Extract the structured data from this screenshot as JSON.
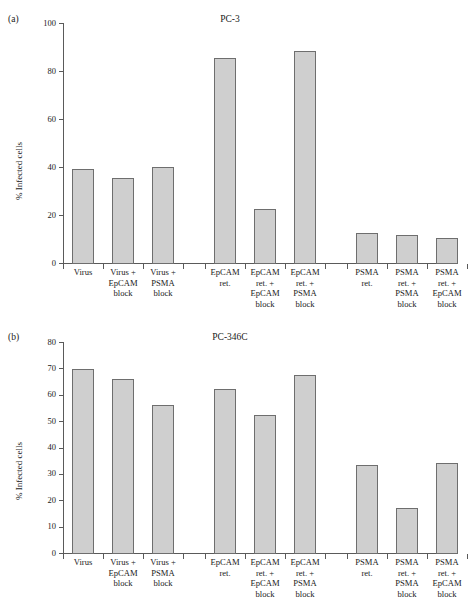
{
  "figure": {
    "panels": [
      {
        "letter": "(a)",
        "title": "PC-3",
        "ylabel": "% Infected cells"
      },
      {
        "letter": "(b)",
        "title": "PC-346C",
        "ylabel": "% Infected cells"
      }
    ]
  },
  "chart_data": [
    {
      "type": "bar",
      "title": "PC-3",
      "panel": "(a)",
      "xlabel": "",
      "ylabel": "% Infected cells",
      "ylim": [
        0,
        100
      ],
      "yticks": [
        0,
        20,
        40,
        60,
        80,
        100
      ],
      "ytick_labels": [
        "0",
        "20",
        "40",
        "60",
        "80",
        "100"
      ],
      "grid": false,
      "legend": "none",
      "groups": [
        {
          "name": "Virus",
          "categories": [
            "Virus",
            "Virus +\nEpCAM\nblock",
            "Virus +\nPSMA\nblock"
          ],
          "values": [
            39,
            35.5,
            40
          ]
        },
        {
          "name": "EpCAM ret.",
          "categories": [
            "EpCAM\nret.",
            "EpCAM\nret. +\nEpCAM\nblock",
            "EpCAM\nret. +\nPSMA\nblock"
          ],
          "values": [
            85.5,
            22.5,
            88.5
          ]
        },
        {
          "name": "PSMA ret.",
          "categories": [
            "PSMA\nret.",
            "PSMA\nret. +\nPSMA\nblock",
            "PSMA\nret. +\nEpCAM\nblock"
          ],
          "values": [
            12.7,
            11.6,
            10.6
          ]
        }
      ],
      "categories": [
        "Virus",
        "Virus +\nEpCAM\nblock",
        "Virus +\nPSMA\nblock",
        "EpCAM\nret.",
        "EpCAM\nret. +\nEpCAM\nblock",
        "EpCAM\nret. +\nPSMA\nblock",
        "PSMA\nret.",
        "PSMA\nret. +\nPSMA\nblock",
        "PSMA\nret. +\nEpCAM\nblock"
      ],
      "values": [
        39,
        35.5,
        40,
        85.5,
        22.5,
        88.5,
        12.7,
        11.6,
        10.6
      ]
    },
    {
      "type": "bar",
      "title": "PC-346C",
      "panel": "(b)",
      "xlabel": "",
      "ylabel": "% Infected cells",
      "ylim": [
        0,
        80
      ],
      "yticks": [
        0,
        10,
        20,
        30,
        40,
        50,
        60,
        70,
        80
      ],
      "ytick_labels": [
        "0",
        "10",
        "20",
        "30",
        "40",
        "50",
        "60",
        "70",
        "80"
      ],
      "grid": false,
      "legend": "none",
      "groups": [
        {
          "name": "Virus",
          "categories": [
            "Virus",
            "Virus +\nEpCAM\nblock",
            "Virus +\nPSMA\nblock"
          ],
          "values": [
            69.7,
            66,
            56
          ]
        },
        {
          "name": "EpCAM ret.",
          "categories": [
            "EpCAM\nret.",
            "EpCAM\nret. +\nEpCAM\nblock",
            "EpCAM\nret. +\nPSMA\nblock"
          ],
          "values": [
            62.1,
            52.2,
            67.4
          ]
        },
        {
          "name": "PSMA ret.",
          "categories": [
            "PSMA\nret.",
            "PSMA\nret. +\nPSMA\nblock",
            "PSMA\nret. +\nEpCAM\nblock"
          ],
          "values": [
            33.5,
            17,
            34
          ]
        }
      ],
      "categories": [
        "Virus",
        "Virus +\nEpCAM\nblock",
        "Virus +\nPSMA\nblock",
        "EpCAM\nret.",
        "EpCAM\nret. +\nEpCAM\nblock",
        "EpCAM\nret. +\nPSMA\nblock",
        "PSMA\nret.",
        "PSMA\nret. +\nPSMA\nblock",
        "PSMA\nret. +\nEpCAM\nblock"
      ],
      "values": [
        69.7,
        66,
        56,
        62.1,
        52.2,
        67.4,
        33.5,
        17,
        34
      ]
    }
  ],
  "style": {
    "bar_fill": "#cfcfcf",
    "bar_stroke": "#6e6e6e",
    "axis_color": "#5a5a5a",
    "text_color": "#1a1a1a",
    "background": "#ffffff"
  }
}
